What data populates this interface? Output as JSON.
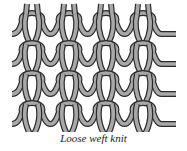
{
  "figure": {
    "caption": "Loose weft knit",
    "structure": "weft knit",
    "rows": 4,
    "columns": 4,
    "colors": {
      "yarn_fill": "#a8a8a8",
      "yarn_outline": "#2b2b2b",
      "background": "#ffffff"
    }
  }
}
